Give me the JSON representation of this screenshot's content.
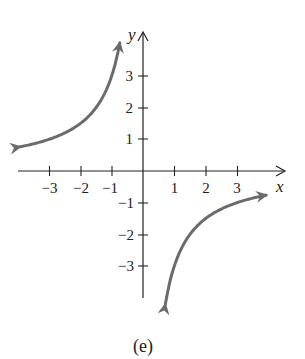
{
  "chart_data": {
    "type": "line",
    "title": "",
    "caption": "(e)",
    "xlabel": "x",
    "ylabel": "y",
    "xlim": [
      -4,
      4.4
    ],
    "ylim": [
      -4.2,
      4.2
    ],
    "x_ticks": [
      -3,
      -2,
      -1,
      1,
      2,
      3
    ],
    "y_ticks": [
      -3,
      -2,
      -1,
      1,
      2,
      3
    ],
    "x_tick_labels": [
      "−3",
      "−2",
      "−1",
      "1",
      "2",
      "3"
    ],
    "y_tick_labels": [
      "−3",
      "−2",
      "−1",
      "1",
      "2",
      "3"
    ],
    "grid": false,
    "legend": null,
    "function": "y = -3/x (hyperbola, branches in quadrants II and IV)",
    "series": [
      {
        "name": "branch-left",
        "x": [
          -3.9,
          -3,
          -2,
          -1.5,
          -1,
          -0.75
        ],
        "y": [
          0.77,
          1,
          1.5,
          2,
          3,
          4
        ]
      },
      {
        "name": "branch-right",
        "x": [
          0.72,
          1,
          1.5,
          2,
          3,
          3.9
        ],
        "y": [
          -4.2,
          -3,
          -2,
          -1.5,
          -1,
          -0.77
        ]
      }
    ],
    "colors": {
      "curve": "#6b6b6b",
      "axes": "#222222"
    }
  }
}
